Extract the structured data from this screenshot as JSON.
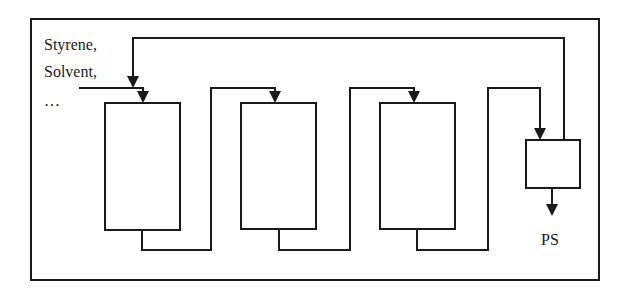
{
  "diagram": {
    "type": "process-flow",
    "feed_label_lines": [
      "Styrene,",
      "Solvent,",
      "…"
    ],
    "product_label": "PS",
    "nodes": [
      {
        "id": "reactor-1",
        "kind": "reactor"
      },
      {
        "id": "reactor-2",
        "kind": "reactor"
      },
      {
        "id": "reactor-3",
        "kind": "reactor"
      },
      {
        "id": "separator",
        "kind": "separator"
      }
    ],
    "edges": [
      {
        "from": "feed",
        "to": "reactor-1"
      },
      {
        "from": "reactor-1",
        "to": "reactor-2"
      },
      {
        "from": "reactor-2",
        "to": "reactor-3"
      },
      {
        "from": "reactor-3",
        "to": "separator"
      },
      {
        "from": "separator",
        "to": "product",
        "label": "PS"
      },
      {
        "from": "separator",
        "to": "reactor-1",
        "kind": "recycle"
      }
    ],
    "colors": {
      "line": "#1a1a1a",
      "background": "#ffffff"
    }
  }
}
